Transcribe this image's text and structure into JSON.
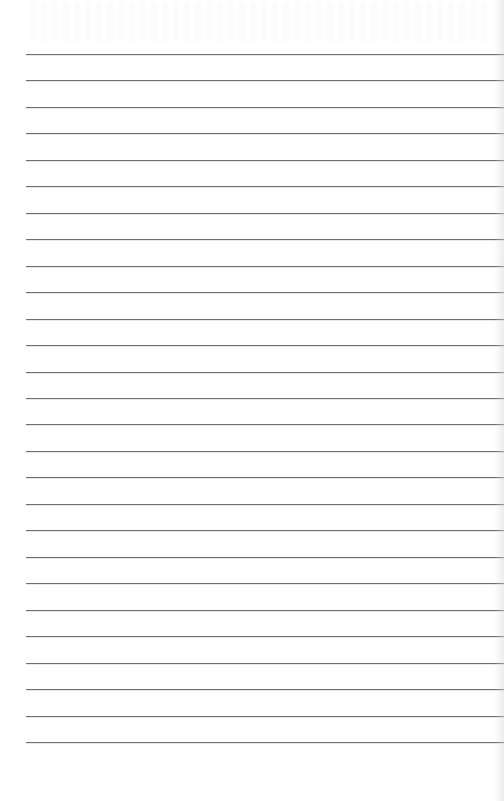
{
  "page": {
    "type": "blank lined paper",
    "line_count": 27,
    "first_line_y": 54,
    "line_spacing": 26.46,
    "line_left": 26,
    "line_color": "#6e6e6e",
    "background_color": "#ffffff"
  }
}
